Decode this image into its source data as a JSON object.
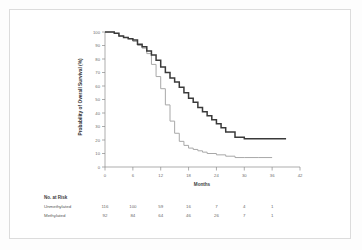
{
  "figure": {
    "border_color": "#dcdcdc",
    "background": "#ffffff"
  },
  "chart_data": {
    "type": "line",
    "title": "",
    "subtitle": "",
    "xlabel": "Months",
    "ylabel": "Probability of Overall Survival (%)",
    "xlim": [
      0,
      42
    ],
    "ylim": [
      0,
      100
    ],
    "xticks": [
      0,
      6,
      12,
      18,
      24,
      30,
      36,
      42
    ],
    "yticks": [
      0,
      10,
      20,
      30,
      40,
      50,
      60,
      70,
      80,
      90,
      100
    ],
    "grid": false,
    "legend_position": "none",
    "xtick_labels": [
      "0",
      "6",
      "12",
      "18",
      "24",
      "30",
      "36",
      "42"
    ],
    "ytick_labels": [
      "0",
      "10",
      "20",
      "30",
      "40",
      "50",
      "60",
      "70",
      "80",
      "90",
      "100"
    ],
    "series": [
      {
        "name": "Methylated",
        "color": "#3a3a3a",
        "width": 1.5,
        "step": "post",
        "x": [
          0,
          1,
          2,
          3,
          4,
          5,
          6,
          7,
          8,
          9,
          10,
          11,
          12,
          13,
          14,
          15,
          16,
          17,
          18,
          19,
          20,
          21,
          22,
          23,
          24,
          25,
          26,
          27,
          28,
          29,
          30,
          33,
          36,
          39
        ],
        "values": [
          100,
          100,
          99,
          97,
          96,
          95,
          94,
          91,
          89,
          86,
          83,
          79,
          74,
          70,
          66,
          63,
          59,
          55,
          51,
          48,
          44,
          41,
          38,
          35,
          32,
          29,
          26,
          26,
          22,
          22,
          21,
          21,
          21,
          21
        ]
      },
      {
        "name": "Unmethylated",
        "color": "#a8a8a8",
        "width": 1.0,
        "step": "post",
        "x": [
          0,
          1,
          2,
          3,
          4,
          5,
          6,
          7,
          8,
          9,
          10,
          11,
          12,
          13,
          14,
          15,
          16,
          17,
          18,
          19,
          20,
          21,
          22,
          24,
          26,
          28,
          30,
          33,
          36
        ],
        "values": [
          100,
          100,
          99,
          97,
          96,
          95,
          93,
          90,
          88,
          84,
          76,
          67,
          58,
          46,
          34,
          25,
          19,
          16,
          14,
          13,
          12,
          11,
          10,
          9,
          8,
          7,
          7,
          7,
          7
        ]
      }
    ],
    "annotations": []
  },
  "risk_table": {
    "header": "No. at Risk",
    "time_points": [
      0,
      6,
      12,
      18,
      24,
      30,
      36
    ],
    "rows": [
      {
        "label": "Unmethylated",
        "counts": [
          "116",
          "100",
          "59",
          "16",
          "7",
          "4",
          "1"
        ]
      },
      {
        "label": "Methylated",
        "counts": [
          "92",
          "84",
          "64",
          "46",
          "26",
          "7",
          "1"
        ]
      }
    ]
  }
}
